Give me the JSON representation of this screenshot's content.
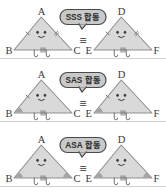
{
  "figure": {
    "language": "Korean",
    "background_color": "#ffffff",
    "triangle_fill": "#d9d9d9",
    "triangle_stroke": "#8f8f8f",
    "bubble_fill": "#c9c9c9",
    "bubble_stroke": "#4a4a4a",
    "label_color": "#3a3a3a",
    "angle_mark_color": "#9a9a9a",
    "congruence_symbol": "≡"
  },
  "rows": [
    {
      "id": "sss",
      "bubble_label": "SSS 합동",
      "criterion": "SSS",
      "korean_word": "합동",
      "left_triangle": {
        "vertices": [
          "A",
          "B",
          "C"
        ],
        "side_ticks": {
          "left": 1,
          "right": 2,
          "bottom": 3
        },
        "angle_marks": [],
        "has_face": true,
        "has_legs": true
      },
      "right_triangle": {
        "vertices": [
          "D",
          "E",
          "F"
        ],
        "side_ticks": {
          "left": 1,
          "right": 2,
          "bottom": 3
        },
        "angle_marks": [],
        "has_face": true,
        "has_legs": true
      }
    },
    {
      "id": "sas",
      "bubble_label": "SAS 합동",
      "criterion": "SAS",
      "korean_word": "합동",
      "left_triangle": {
        "vertices": [
          "A",
          "B",
          "C"
        ],
        "side_ticks": {
          "left": 1,
          "right": 0,
          "bottom": 3
        },
        "angle_marks": [
          "B"
        ],
        "has_face": true,
        "has_legs": true
      },
      "right_triangle": {
        "vertices": [
          "D",
          "E",
          "F"
        ],
        "side_ticks": {
          "left": 1,
          "right": 0,
          "bottom": 3
        },
        "angle_marks": [
          "E"
        ],
        "has_face": true,
        "has_legs": true
      }
    },
    {
      "id": "asa",
      "bubble_label": "ASA 합동",
      "criterion": "ASA",
      "korean_word": "합동",
      "left_triangle": {
        "vertices": [
          "A",
          "B",
          "C"
        ],
        "side_ticks": {
          "left": 0,
          "right": 0,
          "bottom": 3
        },
        "angle_marks": [
          "B",
          "C"
        ],
        "has_face": true,
        "has_legs": true
      },
      "right_triangle": {
        "vertices": [
          "D",
          "E",
          "F"
        ],
        "side_ticks": {
          "left": 0,
          "right": 0,
          "bottom": 3
        },
        "angle_marks": [
          "E",
          "F"
        ],
        "has_face": true,
        "has_legs": true
      }
    }
  ]
}
